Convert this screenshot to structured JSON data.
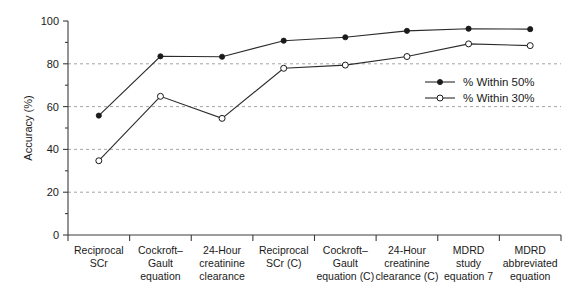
{
  "chart_data": {
    "type": "line",
    "title": "",
    "xlabel": "",
    "ylabel": "Accuracy (%)",
    "ylim": [
      0,
      100
    ],
    "yticks": [
      0,
      20,
      40,
      60,
      80,
      100
    ],
    "ytick_labels": [
      "0",
      "20",
      "40",
      "60",
      "80",
      "100"
    ],
    "minor_yticks": [
      10,
      30,
      50,
      70,
      90
    ],
    "gridlines": [
      20,
      40,
      60,
      80
    ],
    "grid": true,
    "legend_position": "center-right",
    "categories": [
      "Reciprocal SCr",
      "Cockroft–Gault equation",
      "24-Hour creatinine clearance",
      "Reciprocal SCr (C)",
      "Cockroft–Gault equation (C)",
      "24-Hour creatinine clearance (C)",
      "MDRD study equation 7",
      "MDRD abbreviated equation"
    ],
    "category_lines": [
      [
        "Reciprocal",
        "SCr"
      ],
      [
        "Cockroft–",
        "Gault",
        "equation"
      ],
      [
        "24-Hour",
        "creatinine",
        "clearance"
      ],
      [
        "Reciprocal",
        "SCr (C)"
      ],
      [
        "Cockroft–",
        "Gault",
        "equation (C)"
      ],
      [
        "24-Hour",
        "creatinine",
        "clearance (C)"
      ],
      [
        "MDRD",
        "study",
        "equation 7"
      ],
      [
        "MDRD",
        "abbreviated",
        "equation"
      ]
    ],
    "series": [
      {
        "name": "% Within 50%",
        "marker": "filled-circle",
        "values": [
          55.8,
          83.5,
          83.3,
          90.8,
          92.4,
          95.4,
          96.4,
          96.2
        ]
      },
      {
        "name": "% Within 30%",
        "marker": "open-circle",
        "values": [
          34.7,
          64.8,
          54.5,
          77.9,
          79.4,
          83.4,
          89.3,
          88.5
        ]
      }
    ]
  },
  "legend": {
    "entries": [
      {
        "label": "% Within 50%",
        "marker": "filled-circle"
      },
      {
        "label": "% Within 30%",
        "marker": "open-circle"
      }
    ]
  },
  "colors": {
    "line": "#2b2b2b",
    "grid": "#9a9a9a",
    "axis": "#3c3c3c",
    "text": "#1a1a1a",
    "background": "#ffffff"
  }
}
